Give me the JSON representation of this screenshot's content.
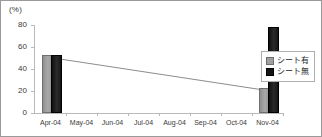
{
  "chart_data": {
    "type": "bar",
    "title": "",
    "xlabel": "",
    "ylabel": "(%)",
    "ylim": [
      0,
      80
    ],
    "yticks": [
      "0",
      "20",
      "40",
      "60",
      "80"
    ],
    "ytick_values": [
      0,
      20,
      40,
      60,
      80
    ],
    "grid": false,
    "legend_position": "right",
    "categories": [
      "Apr-04",
      "May-04",
      "Jun-04",
      "Jul-04",
      "Aug-04",
      "Sep-04",
      "Oct-04",
      "Nov-04"
    ],
    "series": [
      {
        "name": "シート有",
        "color": "#a0a0a0",
        "values": [
          51,
          null,
          null,
          null,
          null,
          null,
          null,
          21
        ]
      },
      {
        "name": "シート無",
        "color": "#141414",
        "values": [
          51,
          null,
          null,
          null,
          null,
          null,
          null,
          76
        ]
      }
    ],
    "trend_line": {
      "color": "#8c8c8c",
      "from": {
        "category": "Apr-04",
        "value": 51
      },
      "to": {
        "category": "Nov-04",
        "value": 21
      }
    }
  }
}
